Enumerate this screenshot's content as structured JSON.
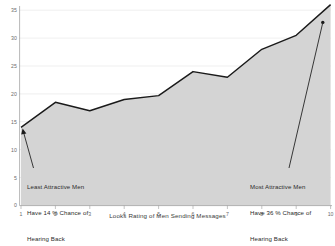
{
  "chart_data": {
    "type": "area",
    "title": "",
    "xlabel": "Looks Rating of Men Sending Messages",
    "ylabel": "",
    "categories": [
      1,
      2,
      3,
      4,
      5,
      6,
      7,
      8,
      9,
      10
    ],
    "values": [
      14,
      18.5,
      17,
      19,
      19.7,
      24,
      23,
      28,
      30.5,
      36
    ],
    "series": [
      {
        "name": "Chance of Hearing Back (%)",
        "values": [
          14,
          18.5,
          17,
          19,
          19.7,
          24,
          23,
          28,
          30.5,
          36
        ]
      }
    ],
    "xlim": [
      1,
      10
    ],
    "ylim": [
      0,
      35
    ],
    "x_ticks": [
      "1",
      "2",
      "3",
      "4",
      "5",
      "6",
      "7",
      "8",
      "9",
      "10"
    ],
    "y_ticks": [
      "0",
      "5",
      "10",
      "15",
      "20",
      "25",
      "30",
      "35"
    ],
    "grid": true,
    "legend": "none",
    "fill_color": "#d4d4d4",
    "line_color": "#1a1a1a",
    "axis_color": "#a0a0a0",
    "annotations": [
      {
        "id": "least-attractive",
        "text": "Least Attractive Men\nHave 14 % Chance of\nHearing Back",
        "points_to_x": 1,
        "points_to_y": 14
      },
      {
        "id": "most-attractive",
        "text": "Most Attractive Men\nHave 36 % Chance of\nHearing Back",
        "points_to_x": 10,
        "points_to_y": 33
      }
    ]
  },
  "axis": {
    "x_title": "Looks Rating of Men Sending Messages",
    "y_tick_labels": [
      "35",
      "30",
      "25",
      "20",
      "15",
      "10",
      "5",
      "0"
    ],
    "x_tick_labels": [
      "1",
      "2",
      "3",
      "4",
      "5",
      "6",
      "7",
      "8",
      "9",
      "10"
    ]
  },
  "annotations": {
    "left": {
      "line1": "Least Attractive Men",
      "line2": "Have 14 % Chance of",
      "line3": "Hearing Back"
    },
    "right": {
      "line1": "Most Attractive Men",
      "line2": "Have 36 % Chance of",
      "line3": "Hearing Back"
    }
  }
}
